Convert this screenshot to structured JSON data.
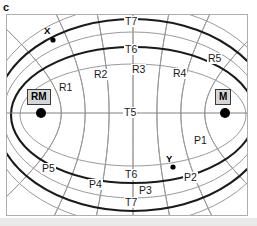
{
  "figure": {
    "panel_letter": "c",
    "frame": {
      "x": 6,
      "y": 14,
      "width": 242,
      "height": 202
    },
    "colors": {
      "ellipse_stroke": "#1a1a1a",
      "hyperbola_stroke": "#9a9a9a",
      "axis_line": "#808080",
      "node_fill": "#d6d6d6",
      "node_border": "#3a3a3a",
      "frame_border": "#aeaeae",
      "background": "#ffffff",
      "marker_fill": "#000000"
    },
    "foci": [
      {
        "id": "RM",
        "label": "RM",
        "x": 41,
        "y": 113,
        "box_x": 27,
        "box_y": 89
      },
      {
        "id": "M",
        "label": "M",
        "x": 225,
        "y": 113,
        "box_x": 215,
        "box_y": 89
      }
    ],
    "markers": [
      {
        "id": "X",
        "label": "X",
        "x": 53,
        "y": 40,
        "label_x": 44,
        "label_y": 26
      },
      {
        "id": "Y",
        "label": "Y",
        "x": 173,
        "y": 167,
        "label_x": 166,
        "label_y": 154
      }
    ],
    "axis_label": {
      "text": "T5",
      "x": 123,
      "y": 107
    },
    "ellipse_labels": [
      {
        "text": "T7",
        "x": 124,
        "y": 16
      },
      {
        "text": "T6",
        "x": 124,
        "y": 44
      },
      {
        "text": "T6",
        "x": 124,
        "y": 169
      },
      {
        "text": "T7",
        "x": 124,
        "y": 197
      }
    ],
    "hyperbola_labels": [
      {
        "text": "R1",
        "x": 58,
        "y": 82
      },
      {
        "text": "R2",
        "x": 93,
        "y": 69
      },
      {
        "text": "R3",
        "x": 131,
        "y": 64
      },
      {
        "text": "R4",
        "x": 172,
        "y": 68
      },
      {
        "text": "R5",
        "x": 207,
        "y": 53
      },
      {
        "text": "P1",
        "x": 193,
        "y": 135
      },
      {
        "text": "P2",
        "x": 183,
        "y": 172
      },
      {
        "text": "P3",
        "x": 138,
        "y": 185
      },
      {
        "text": "P4",
        "x": 88,
        "y": 179
      },
      {
        "text": "P5",
        "x": 41,
        "y": 163
      }
    ],
    "ellipses": [
      {
        "name": "T7-outer",
        "cx": 133,
        "cy": 115,
        "rx": 138,
        "ry": 96,
        "stroke": "#1a1a1a",
        "width": 2.1
      },
      {
        "name": "T6-inner",
        "cx": 133,
        "cy": 115,
        "rx": 122,
        "ry": 68,
        "stroke": "#1a1a1a",
        "width": 2.1
      },
      {
        "name": "unlabeled-1",
        "cx": 133,
        "cy": 115,
        "rx": 130,
        "ry": 83,
        "stroke": "#9a9a9a",
        "width": 1.0
      },
      {
        "name": "unlabeled-2",
        "cx": 133,
        "cy": 115,
        "rx": 113,
        "ry": 51,
        "stroke": "#9a9a9a",
        "width": 1.0
      },
      {
        "name": "unlabeled-3",
        "cx": 133,
        "cy": 115,
        "rx": 146,
        "ry": 109,
        "stroke": "#9a9a9a",
        "width": 1.0
      }
    ],
    "hyperbolas": [
      {
        "name": "R1",
        "k": -0.78
      },
      {
        "name": "R2",
        "k": -0.52
      },
      {
        "name": "R3",
        "k": -0.26
      },
      {
        "name": "R4",
        "k": 0.0
      },
      {
        "name": "R5",
        "k": 0.26
      },
      {
        "name": "P1",
        "k": 0.52
      },
      {
        "name": "P2",
        "k": 0.78
      }
    ]
  }
}
